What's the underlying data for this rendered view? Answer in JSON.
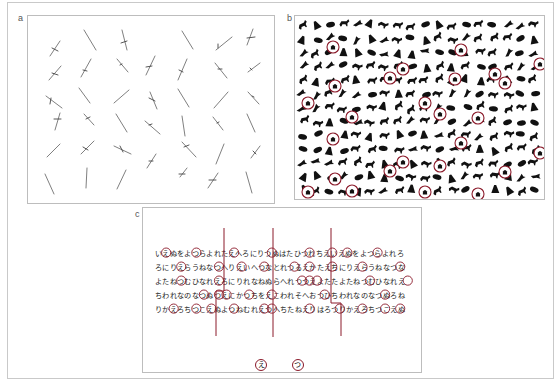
{
  "figure": {
    "panels": [
      {
        "id": "a",
        "label": "a",
        "description": "Oriented line segments search display"
      },
      {
        "id": "b",
        "label": "b",
        "description": "Animal silhouettes search display with circled targets"
      },
      {
        "id": "c",
        "label": "c",
        "description": "Hiragana cancellation task with circled targets"
      }
    ]
  },
  "colors": {
    "marker": "#8b1a2a",
    "ink": "#222222",
    "segment": "#6e6e6e",
    "border": "#bdbdbd"
  },
  "panel_c": {
    "rows": [
      "いえぬをよつらよれたえへろにりつぬはたひつれちえいえぬをよつらよれろ",
      "ろにりえらうねなつへりえいへつなとれつるえかたえちにりえらうねなつな",
      "よたねつむひなれえろにりれなねぬらへれつつえよたたよたねつむひなれえ",
      "ちわれなのなつぬつえにかつちをえこわれそへおつひちわれなのなつぬろね",
      "りかえろちつこえぬよつねむれえつへちたねえりはろつりかえろちつこえぬ"
    ],
    "targets": [
      "え",
      "つ"
    ]
  }
}
